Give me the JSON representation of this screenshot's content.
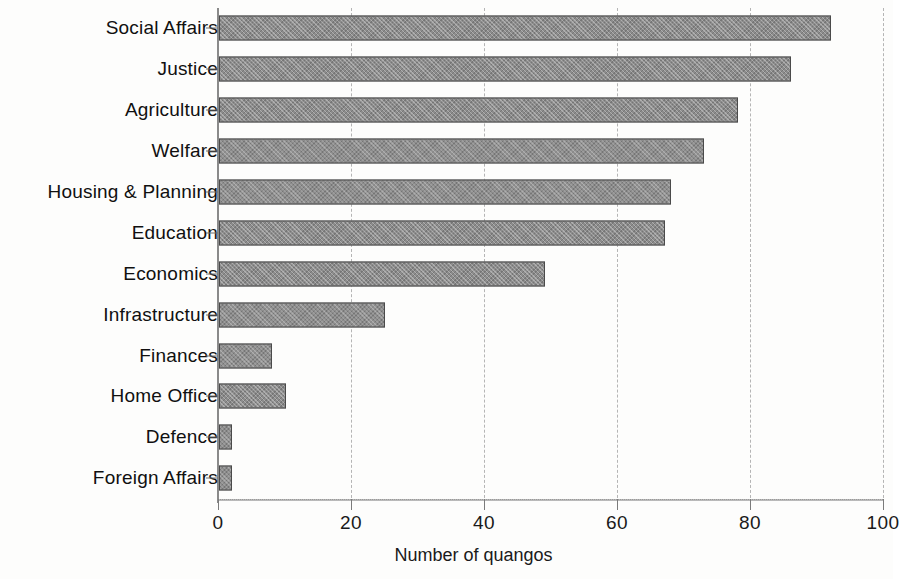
{
  "chart_data": {
    "type": "bar",
    "orientation": "horizontal",
    "title": "",
    "xlabel": "Number of quangos",
    "ylabel": "",
    "xlim": [
      0,
      100
    ],
    "xticks": [
      0,
      20,
      40,
      60,
      80,
      100
    ],
    "xtick_labels": [
      "0",
      "20",
      "40",
      "60",
      "80",
      "100"
    ],
    "grid": "vertical dashed gridlines",
    "legend": "none",
    "bar_color": "#8c8c8c",
    "bar_edge_color": "#4a4a4a",
    "categories": [
      "Social Affairs",
      "Justice",
      "Agriculture",
      "Welfare",
      "Housing & Planning",
      "Education",
      "Economics",
      "Infrastructure",
      "Finances",
      "Home Office",
      "Defence",
      "Foreign Affairs"
    ],
    "values": [
      92,
      86,
      78,
      73,
      68,
      67,
      49,
      25,
      8,
      10,
      2,
      2
    ]
  },
  "axis": {
    "x_title": "Number of quangos"
  }
}
